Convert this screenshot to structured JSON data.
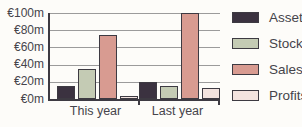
{
  "chart_data": {
    "type": "bar",
    "title": "",
    "categories": [
      "This year",
      "Last year"
    ],
    "series": [
      {
        "name": "Assets",
        "color": "#3b3240",
        "values": [
          15,
          20
        ]
      },
      {
        "name": "Stock",
        "color": "#c4cbb4",
        "values": [
          35,
          15
        ]
      },
      {
        "name": "Sales",
        "color": "#d89b91",
        "values": [
          75,
          100
        ]
      },
      {
        "name": "Profits",
        "color": "#f3e3df",
        "values": [
          3,
          13
        ]
      }
    ],
    "y_axis": {
      "min": 0,
      "max": 100,
      "step": 20,
      "tick_labels": [
        "€100m",
        "€80m",
        "€60m",
        "€40m",
        "€20m",
        "€0m"
      ],
      "unit": "€ millions"
    },
    "legend": {
      "position": "right",
      "entries": [
        "Assets",
        "Stock",
        "Sales",
        "Profits"
      ]
    },
    "grid": true
  },
  "colors": {
    "background": "#fdfcf9",
    "axis": "#3d3a42",
    "gridline": "#9b9b9b",
    "text": "#45444b",
    "bar_border": "#3d3a42"
  }
}
